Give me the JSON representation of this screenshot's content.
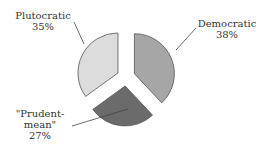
{
  "chart_data": {
    "type": "pie",
    "title": "",
    "categories": [
      "Democratic",
      "\"Prudent-mean\"",
      "Plutocratic"
    ],
    "values": [
      38,
      27,
      35
    ],
    "unit": "%",
    "exploded": true,
    "start_angle_deg": 0,
    "direction": "clockwise",
    "colors": [
      "#a6a6a6",
      "#6b6b6b",
      "#dcdcdc"
    ],
    "stroke": "#555555",
    "legend": "none",
    "labels": [
      {
        "name": "Democratic",
        "value_text": "38%"
      },
      {
        "name_line1": "\"Prudent-",
        "name_line2": "mean\"",
        "value_text": "27%"
      },
      {
        "name": "Plutocratic",
        "value_text": "35%"
      }
    ]
  }
}
